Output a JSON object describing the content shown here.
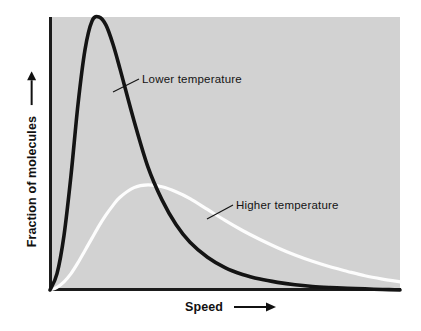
{
  "chart_data": {
    "type": "line",
    "title": "",
    "subtitle": "",
    "xlabel": "Speed",
    "ylabel": "Fraction of molecules",
    "xlabel_arrow": "⟶",
    "ylabel_arrow": "⟶",
    "grid": false,
    "legend_position": "inline-annotations",
    "axis_ticks": {
      "x": [],
      "y": []
    },
    "xlim": [
      0,
      1
    ],
    "ylim": [
      0,
      1
    ],
    "x": [
      0.0,
      0.02,
      0.04,
      0.06,
      0.08,
      0.1,
      0.12,
      0.14,
      0.16,
      0.18,
      0.2,
      0.24,
      0.28,
      0.32,
      0.36,
      0.4,
      0.45,
      0.5,
      0.55,
      0.6,
      0.65,
      0.7,
      0.75,
      0.8,
      0.85,
      0.9,
      0.95,
      1.0
    ],
    "series": [
      {
        "name": "Lower temperature",
        "color": "#141414",
        "style": "solid",
        "width": 3.6,
        "peak_x": 0.125,
        "peak_y": 1.0,
        "values": [
          0.0,
          0.06,
          0.2,
          0.42,
          0.68,
          0.88,
          0.985,
          1.0,
          0.97,
          0.9,
          0.81,
          0.62,
          0.45,
          0.33,
          0.24,
          0.175,
          0.12,
          0.082,
          0.057,
          0.04,
          0.028,
          0.019,
          0.013,
          0.009,
          0.006,
          0.004,
          0.002,
          0.0
        ]
      },
      {
        "name": "Higher temperature",
        "color": "#fdfdfd",
        "style": "solid",
        "width": 3.2,
        "peak_x": 0.29,
        "peak_y": 0.385,
        "values": [
          0.0,
          0.01,
          0.03,
          0.06,
          0.1,
          0.145,
          0.19,
          0.235,
          0.275,
          0.31,
          0.34,
          0.375,
          0.385,
          0.378,
          0.36,
          0.335,
          0.295,
          0.255,
          0.218,
          0.185,
          0.155,
          0.128,
          0.105,
          0.085,
          0.068,
          0.052,
          0.04,
          0.03
        ]
      }
    ],
    "annotations": [
      {
        "id": "lower-temperature",
        "text": "Lower temperature",
        "label_x": 142,
        "label_y": 73,
        "leader_from_x": 113,
        "leader_from_y": 92,
        "leader_to_x": 139,
        "leader_to_y": 79,
        "target_series": "Lower temperature"
      },
      {
        "id": "higher-temperature",
        "text": "Higher temperature",
        "label_x": 236,
        "label_y": 199,
        "leader_from_x": 207,
        "leader_from_y": 219,
        "leader_to_x": 233,
        "leader_to_y": 205,
        "target_series": "Higher temperature"
      }
    ],
    "colors": {
      "panel_background": "#d2d2d2",
      "page_background": "#ffffff",
      "axis": "#1b1b1b",
      "lower_temperature_curve": "#141414",
      "higher_temperature_curve": "#fdfdfd",
      "text": "#111111"
    }
  },
  "figure": {
    "panel": {
      "left": 50,
      "top": 17,
      "width": 350,
      "height": 273
    }
  }
}
